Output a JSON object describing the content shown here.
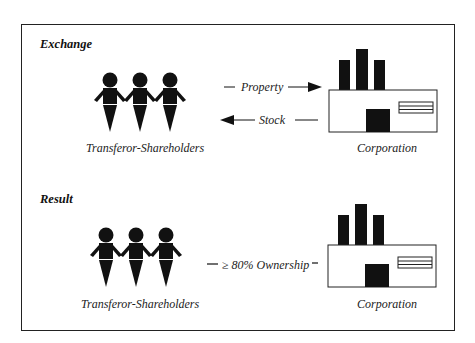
{
  "diagram": {
    "exchange": {
      "title": "Exchange",
      "left_label": "Transferor-Shareholders",
      "right_label": "Corporation",
      "arrow_to_corp_label": "Property",
      "arrow_to_shareholders_label": "Stock"
    },
    "result": {
      "title": "Result",
      "left_label": "Transferor-Shareholders",
      "right_label": "Corporation",
      "link_label": "≥ 80% Ownership"
    },
    "icons": {
      "shareholders": "people-holding-hands-icon",
      "corporation": "factory-icon"
    },
    "colors": {
      "ink": "#111111",
      "background": "#ffffff"
    }
  }
}
